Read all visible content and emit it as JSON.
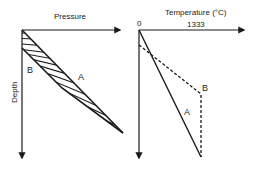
{
  "left_panel": {
    "x_axis_label": "Pressure",
    "y_axis_label": "Depth",
    "curve_a_label": "A",
    "curve_b_label": "B",
    "shaded_region": "hatched area between curve A and curve B"
  },
  "right_panel": {
    "x_axis_label": "Temperature (°C)",
    "x_origin_tick": "0",
    "x_tick_value": "1333",
    "curve_a_label": "A",
    "curve_b_label": "B",
    "curve_a_style": "solid",
    "curve_b_style": "dashed"
  },
  "colors": {
    "line": "#1a1a1a",
    "background": "#ffffff"
  }
}
